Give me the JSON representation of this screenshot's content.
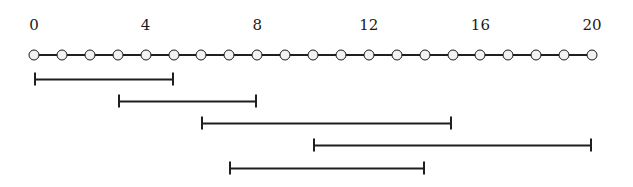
{
  "figure": {
    "width": 633,
    "height": 187,
    "background_color": "#ffffff",
    "line_color": "#1f1f1f",
    "node_fill_color": "#f2f2f2",
    "node_stroke_color": "#1a1a1a",
    "label_color": "#1a1a1a"
  },
  "axis": {
    "min": 0,
    "max": 20,
    "node_count": 21,
    "tick_labels": [
      {
        "value": 0,
        "text": "0"
      },
      {
        "value": 4,
        "text": "4"
      },
      {
        "value": 8,
        "text": "8"
      },
      {
        "value": 12,
        "text": "12"
      },
      {
        "value": 16,
        "text": "16"
      },
      {
        "value": 20,
        "text": "20"
      }
    ],
    "nodes": [
      0,
      1,
      2,
      3,
      4,
      5,
      6,
      7,
      8,
      9,
      10,
      11,
      12,
      13,
      14,
      15,
      16,
      17,
      18,
      19,
      20
    ]
  },
  "intervals": [
    {
      "index": 1,
      "start": 0,
      "end": 5
    },
    {
      "index": 2,
      "start": 3,
      "end": 8
    },
    {
      "index": 3,
      "start": 6,
      "end": 15
    },
    {
      "index": 4,
      "start": 10,
      "end": 20
    },
    {
      "index": 5,
      "start": 7,
      "end": 14
    }
  ],
  "chart_data": {
    "type": "bar",
    "xlabel": "",
    "ylabel": "",
    "xlim": [
      0,
      20
    ],
    "grid": false,
    "legend": null,
    "categories": [
      "1",
      "2",
      "3",
      "4",
      "5"
    ],
    "x_tick_labels": [
      "0",
      "4",
      "8",
      "12",
      "16",
      "20"
    ],
    "x_tick_values": [
      0,
      4,
      8,
      12,
      16,
      20
    ],
    "intervals": [
      {
        "start": 0,
        "end": 5,
        "length": 5
      },
      {
        "start": 3,
        "end": 8,
        "length": 5
      },
      {
        "start": 6,
        "end": 15,
        "length": 9
      },
      {
        "start": 10,
        "end": 20,
        "length": 10
      },
      {
        "start": 7,
        "end": 14,
        "length": 7
      }
    ],
    "values": [
      5,
      5,
      9,
      10,
      7
    ],
    "node_positions": [
      0,
      1,
      2,
      3,
      4,
      5,
      6,
      7,
      8,
      9,
      10,
      11,
      12,
      13,
      14,
      15,
      16,
      17,
      18,
      19,
      20
    ]
  },
  "geometry": {
    "axis_left_px": 34,
    "axis_right_px": 592,
    "axis_y_px": 55,
    "label_y_px": 18,
    "interval_y_px": [
      79,
      101,
      123,
      145,
      168
    ]
  }
}
